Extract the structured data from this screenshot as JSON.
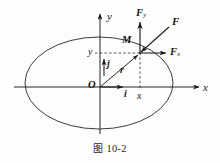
{
  "figure": {
    "caption_prefix": "图",
    "caption_number": "10-2",
    "caption_full": "图 10-2"
  },
  "axes": {
    "x_axis_label": "x",
    "y_axis_label": "y",
    "origin_label": "O"
  },
  "point": {
    "label": "M",
    "x_coordinate_label": "x",
    "y_coordinate_label": "y"
  },
  "vectors": [
    {
      "name": "unit-vector-i",
      "base": "i",
      "sub": ""
    },
    {
      "name": "unit-vector-j",
      "base": "j",
      "sub": ""
    },
    {
      "name": "position-vector-r",
      "base": "r",
      "sub": ""
    },
    {
      "name": "force-F",
      "base": "F",
      "sub": ""
    },
    {
      "name": "force-Fx",
      "base": "F",
      "sub": "x"
    },
    {
      "name": "force-Fy",
      "base": "F",
      "sub": "y"
    }
  ],
  "labels": {
    "i": "i",
    "j": "j",
    "r": "r",
    "F": "F",
    "Fx_base": "F",
    "Fx_sub": "x",
    "Fy_base": "F",
    "Fy_sub": "y"
  },
  "colors": {
    "stroke": "#1a1a1a",
    "dashed": "#3a3a3a",
    "background": "#fdfdfd",
    "text": "#171717"
  },
  "geometry": {
    "origin": [
      100,
      87
    ],
    "point_M": [
      140,
      53
    ],
    "ellipse_center": [
      99,
      83
    ],
    "ellipse_rx": 74,
    "ellipse_ry": 46
  }
}
